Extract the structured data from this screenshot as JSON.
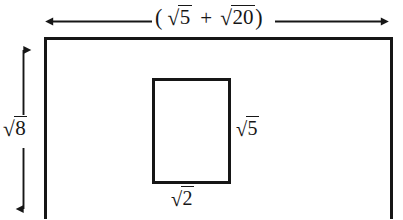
{
  "figure": {
    "kind": "geometry-diagram",
    "background_color": "#ffffff",
    "stroke_color": "#161616",
    "outer_rectangle": {
      "name": "outer-rectangle",
      "x": 44,
      "y": 37,
      "width": 348,
      "height": 182,
      "stroke_width": 3,
      "width_label": {
        "prefix": "(",
        "term_1_radicand": "5",
        "operator": "+",
        "term_2_radicand": "20",
        "suffix": ")",
        "plain_text": "( √5 + √20)"
      },
      "height_label": {
        "radicand": "8",
        "plain_text": "√8"
      }
    },
    "inner_rectangle": {
      "name": "inner-rectangle",
      "x": 152,
      "y": 78,
      "width": 78,
      "height": 105,
      "stroke_width": 3,
      "right_label": {
        "radicand": "5",
        "plain_text": "√5"
      },
      "bottom_label": {
        "radicand": "2",
        "plain_text": "√2"
      }
    },
    "width_dimension_arrow": {
      "name": "width-dimension-arrow",
      "y": 21,
      "x_start": 45,
      "x_end": 389,
      "double_headed": true,
      "gap_start": 152,
      "gap_end": 274
    },
    "height_dimension_arrow": {
      "name": "height-dimension-arrow",
      "x": 23,
      "y_start": 42,
      "y_end": 216,
      "double_headed": true,
      "gap_start": 114,
      "gap_end": 148
    }
  }
}
